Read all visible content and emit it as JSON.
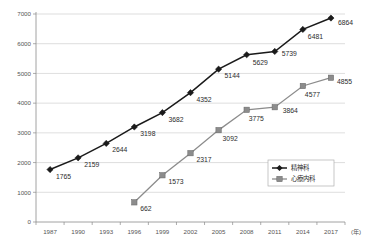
{
  "chart_data": {
    "type": "line",
    "title": "",
    "xlabel": "(年)",
    "ylabel": "",
    "categories": [
      "1987",
      "1990",
      "1993",
      "1996",
      "1999",
      "2002",
      "2005",
      "2008",
      "2011",
      "2014",
      "2017"
    ],
    "ylim": [
      0,
      7000
    ],
    "yticks": [
      "0",
      "1000",
      "2000",
      "3000",
      "4000",
      "5000",
      "6000",
      "7000"
    ],
    "grid": true,
    "legend_position": "inside-right",
    "series": [
      {
        "name": "精神科",
        "marker": "diamond",
        "color": "#1a1a1a",
        "values": [
          1765,
          2159,
          2644,
          3198,
          3682,
          4352,
          5144,
          5629,
          5739,
          6481,
          6864
        ],
        "labels": [
          "1765",
          "2159",
          "2644",
          "3198",
          "3682",
          "4352",
          "5144",
          "5629",
          "5739",
          "6481",
          "6864"
        ]
      },
      {
        "name": "心療内科",
        "marker": "square",
        "color": "#8c8c8c",
        "values": [
          null,
          null,
          null,
          662,
          1573,
          2317,
          3092,
          3775,
          3864,
          4577,
          4855
        ],
        "labels": [
          "",
          "",
          "",
          "662",
          "1573",
          "2317",
          "3092",
          "3775",
          "3864",
          "4577",
          "4855"
        ]
      }
    ]
  }
}
